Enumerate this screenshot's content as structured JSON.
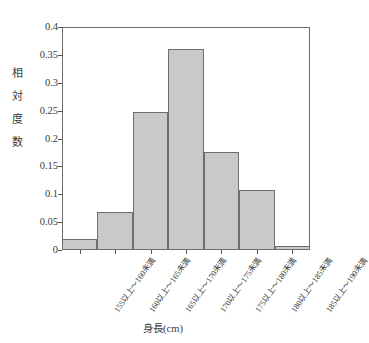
{
  "chart_data": {
    "type": "bar",
    "title": "",
    "subtitle": "",
    "xlabel": "身長(cm)",
    "ylabel": "相対度数",
    "ylabel_chars": [
      "相",
      "対",
      "度",
      "数"
    ],
    "categories": [
      "155以上～160未満",
      "160以上～165未満",
      "165以上～170未満",
      "170以上～175未満",
      "175以上～180未満",
      "180以上～185未満",
      "185以上～190未満"
    ],
    "values": [
      0.02,
      0.068,
      0.248,
      0.36,
      0.176,
      0.107,
      0.007
    ],
    "ylim": [
      0,
      0.4
    ],
    "yticks": [
      0,
      0.05,
      0.1,
      0.15,
      0.2,
      0.25,
      0.3,
      0.35,
      0.4
    ],
    "ytick_labels": [
      "0",
      "0.05",
      "0.1",
      "0.15",
      "0.2",
      "0.25",
      "0.3",
      "0.35",
      "0.4"
    ],
    "grid": false,
    "legend": false,
    "legend_position": "none",
    "bar_fill_color": "#c9c9c9",
    "bar_edge_color": "#6e6e6e",
    "axis_color": "#6b6b6b",
    "text_color": "#3a3a3a",
    "background_color": "#ffffff"
  }
}
